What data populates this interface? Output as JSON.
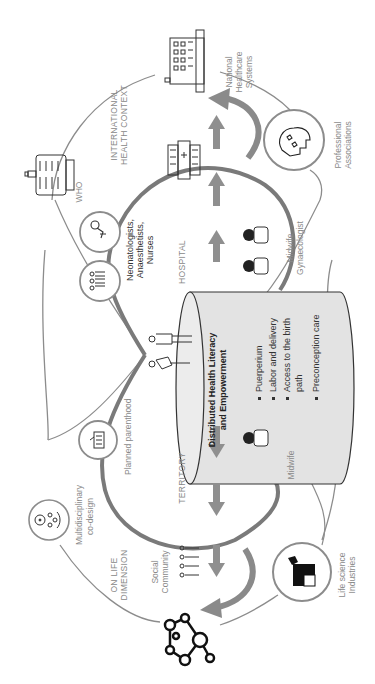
{
  "diagram": {
    "orientation": "rotated 90° counter-clockwise",
    "colors": {
      "thin_line": "#8c8c8c",
      "thick_line": "#7a7a7a",
      "arrow": "#8f8f8f",
      "cylinder_fill": "#e3e3e3",
      "icon": "#222222"
    },
    "contexts": {
      "international": "INTERNATIONAL",
      "international_2": "HEALTH CONTEXT",
      "hospital": "HOSPITAL",
      "territory": "TERRITORY",
      "on_life": "ON LIFE",
      "on_life_2": "DIMENSION"
    },
    "nodes": {
      "national_healthcare": [
        "National",
        "Healthcare",
        "Systems"
      ],
      "professional_associations": [
        "Professional",
        "Associations"
      ],
      "who": "WHO",
      "hospital_staff": [
        "Neonatologists,",
        "Anaesthetists,",
        "Nurses"
      ],
      "midwife_gynaecologist": [
        "Midwife",
        "Gynaecologist"
      ],
      "planned_parenthood": "Planned parenthood",
      "midwife": "Midwife",
      "multidisciplinary": [
        "Multidisciplinary",
        "co-design"
      ],
      "social_community": [
        "Social",
        "Community"
      ],
      "life_science": [
        "Life science",
        "Industries"
      ]
    },
    "center": {
      "title_1": "Distributed Health Literacy",
      "title_2": "and Empowerment",
      "items": [
        "Puerperium",
        "Labor and delivery",
        "Access to the birth",
        "path",
        "Preconception care"
      ]
    },
    "icons": {
      "national_healthcare": "building-icon",
      "who": "capitol-building-icon",
      "professional_associations": "head-puzzle-icon",
      "hospital": "hospital-icon",
      "neonatologists": "baby-icon",
      "team": "group-icon",
      "parents": "couple-icon",
      "midwife": "doctor-icon",
      "planned_parenthood": "clinic-icon",
      "multidisciplinary": "collaboration-icon",
      "social_community": "people-row-icon",
      "life_science": "puzzle-icon",
      "network": "molecule-network-icon"
    }
  }
}
